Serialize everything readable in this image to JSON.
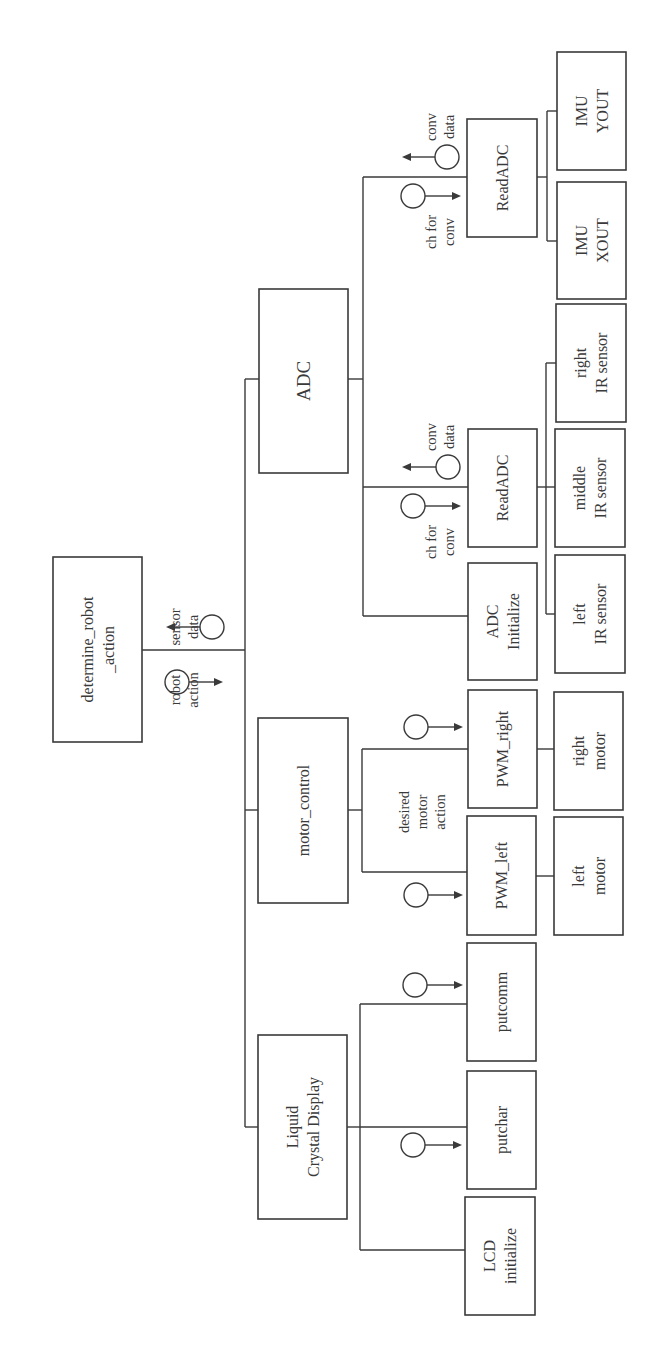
{
  "diagram": {
    "orientation": "rotated -90deg (reads bottom-to-top)",
    "colors": {
      "line": "#3a3a3a",
      "background": "#ffffff"
    },
    "modules": [
      {
        "id": "root",
        "label": [
          "determine_robot",
          "_action"
        ],
        "x": 53,
        "y": 557,
        "w": 89,
        "h": 185,
        "size": "box-label"
      },
      {
        "id": "adc",
        "label": [
          "ADC"
        ],
        "x": 259,
        "y": 289,
        "w": 89,
        "h": 184,
        "size": "box-label-big"
      },
      {
        "id": "motor_control",
        "label": [
          "motor_control"
        ],
        "x": 258,
        "y": 718,
        "w": 90,
        "h": 185,
        "size": "box-label"
      },
      {
        "id": "lcd",
        "label": [
          "Liquid",
          "Crystal Display"
        ],
        "x": 258,
        "y": 1035,
        "w": 89,
        "h": 184,
        "size": "box-label"
      },
      {
        "id": "readadc_imu",
        "label": [
          "ReadADC"
        ],
        "x": 467,
        "y": 119,
        "w": 70,
        "h": 118,
        "size": "box-label"
      },
      {
        "id": "readadc_ir",
        "label": [
          "ReadADC"
        ],
        "x": 468,
        "y": 429,
        "w": 69,
        "h": 118,
        "size": "box-label"
      },
      {
        "id": "adc_initialize",
        "label": [
          "ADC",
          "Initialize"
        ],
        "x": 468,
        "y": 563,
        "w": 69,
        "h": 117,
        "size": "box-label"
      },
      {
        "id": "pwm_right",
        "label": [
          "PWM_right"
        ],
        "x": 468,
        "y": 690,
        "w": 69,
        "h": 118,
        "size": "box-label"
      },
      {
        "id": "pwm_left",
        "label": [
          "PWM_left"
        ],
        "x": 467,
        "y": 816,
        "w": 69,
        "h": 119,
        "size": "box-label"
      },
      {
        "id": "putcomm",
        "label": [
          "putcomm"
        ],
        "x": 467,
        "y": 943,
        "w": 69,
        "h": 118,
        "size": "box-label"
      },
      {
        "id": "putchar",
        "label": [
          "putchar"
        ],
        "x": 467,
        "y": 1071,
        "w": 69,
        "h": 118,
        "size": "box-label"
      },
      {
        "id": "lcd_initialize",
        "label": [
          "LCD",
          "initialize"
        ],
        "x": 465,
        "y": 1197,
        "w": 70,
        "h": 118,
        "size": "box-label"
      },
      {
        "id": "imu_yout",
        "label": [
          "IMU",
          "YOUT"
        ],
        "x": 557,
        "y": 52,
        "w": 69,
        "h": 118,
        "size": "box-label"
      },
      {
        "id": "imu_xout",
        "label": [
          "IMU",
          "XOUT"
        ],
        "x": 557,
        "y": 182,
        "w": 69,
        "h": 117,
        "size": "box-label"
      },
      {
        "id": "right_ir_sensor",
        "label": [
          "right",
          "IR sensor"
        ],
        "x": 556,
        "y": 304,
        "w": 70,
        "h": 118,
        "size": "box-label"
      },
      {
        "id": "middle_ir_sensor",
        "label": [
          "middle",
          "IR sensor"
        ],
        "x": 555,
        "y": 429,
        "w": 70,
        "h": 118,
        "size": "box-label"
      },
      {
        "id": "left_ir_sensor",
        "label": [
          "left",
          "IR sensor"
        ],
        "x": 555,
        "y": 555,
        "w": 70,
        "h": 118,
        "size": "box-label"
      },
      {
        "id": "right_motor",
        "label": [
          "right",
          "motor"
        ],
        "x": 554,
        "y": 692,
        "w": 69,
        "h": 118,
        "size": "box-label"
      },
      {
        "id": "left_motor",
        "label": [
          "left",
          "motor"
        ],
        "x": 554,
        "y": 817,
        "w": 69,
        "h": 118,
        "size": "box-label"
      }
    ],
    "wires": [
      "M142 650 H245",
      "M245 379 V1127",
      "M245 379 H259",
      "M245 810 H258",
      "M245 1127 H258",
      "M348 379 H363",
      "M363 177 V616",
      "M363 177 H467",
      "M363 487 H468",
      "M363 616 H468",
      "M348 810 H362",
      "M362 749 V872",
      "M362 749 H468",
      "M362 872 H467",
      "M347 1127 H360",
      "M360 1004 V1250",
      "M360 1004 H467",
      "M360 1127 H467",
      "M360 1250 H465",
      "M537 177 H547",
      "M547 111 V241",
      "M547 111 H557",
      "M547 241 H557",
      "M537 487 H546",
      "M546 363 V614",
      "M546 363 H556",
      "M546 487 H555",
      "M546 614 H555",
      "M537 749 H554",
      "M536 876 H554"
    ],
    "couples": [
      {
        "id": "sensor_data",
        "cx": 212,
        "cy": 627,
        "r": 12,
        "dir": "left",
        "x2": 166,
        "label": [
          "sensor",
          "data"
        ],
        "lx": 184,
        "ly": 627
      },
      {
        "id": "robot_action",
        "cx": 177,
        "cy": 682,
        "r": 12,
        "dir": "right",
        "x2": 223,
        "label": [
          "robot",
          "action"
        ],
        "lx": 184,
        "ly": 690
      },
      {
        "id": "conv_data_imu",
        "cx": 447,
        "cy": 157,
        "r": 12,
        "dir": "left",
        "x2": 402,
        "label": [
          "conv",
          "data"
        ],
        "lx": 440,
        "ly": 127
      },
      {
        "id": "ch_for_conv_imu",
        "cx": 413,
        "cy": 196,
        "r": 12,
        "dir": "right",
        "x2": 461,
        "label": [
          "ch for",
          "conv"
        ],
        "lx": 440,
        "ly": 232
      },
      {
        "id": "conv_data_ir",
        "cx": 448,
        "cy": 467,
        "r": 12,
        "dir": "left",
        "x2": 402,
        "label": [
          "conv",
          "data"
        ],
        "lx": 440,
        "ly": 437
      },
      {
        "id": "ch_for_conv_ir",
        "cx": 413,
        "cy": 506,
        "r": 12,
        "dir": "right",
        "x2": 461,
        "label": [
          "ch for",
          "conv"
        ],
        "lx": 440,
        "ly": 542
      },
      {
        "id": "to_pwm_right",
        "cx": 416,
        "cy": 727,
        "r": 12,
        "dir": "right",
        "x2": 463,
        "label": [],
        "lx": 0,
        "ly": 0
      },
      {
        "id": "to_pwm_left",
        "cx": 416,
        "cy": 895,
        "r": 12,
        "dir": "right",
        "x2": 463,
        "label": [],
        "lx": 0,
        "ly": 0
      },
      {
        "id": "to_putcomm",
        "cx": 415,
        "cy": 985,
        "r": 12,
        "dir": "right",
        "x2": 463,
        "label": [],
        "lx": 0,
        "ly": 0
      },
      {
        "id": "to_putchar",
        "cx": 413,
        "cy": 1145,
        "r": 12,
        "dir": "right",
        "x2": 462,
        "label": [],
        "lx": 0,
        "ly": 0
      }
    ],
    "annotations": [
      {
        "id": "desired_motor_action",
        "label": [
          "desired",
          "motor",
          "action"
        ],
        "x": 422,
        "y": 812
      }
    ]
  }
}
